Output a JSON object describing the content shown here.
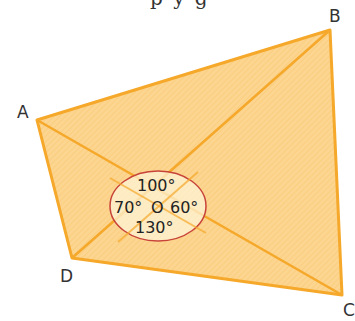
{
  "header": {
    "partial_text": "p y g"
  },
  "diagram": {
    "vertices": [
      {
        "label": "A",
        "x": 37,
        "y": 120
      },
      {
        "label": "B",
        "x": 330,
        "y": 30
      },
      {
        "label": "C",
        "x": 342,
        "y": 295
      },
      {
        "label": "D",
        "x": 72,
        "y": 258
      }
    ],
    "center": {
      "label": "O"
    },
    "angles": {
      "top": "100°",
      "left": "70°",
      "right": "60°",
      "bottom": "130°"
    },
    "colors": {
      "fill": "#fcd590",
      "edge": "#f5a82a",
      "ellipse_fill": "#fdf3d6",
      "ellipse_stroke": "#c8433a",
      "text": "#222222"
    }
  }
}
